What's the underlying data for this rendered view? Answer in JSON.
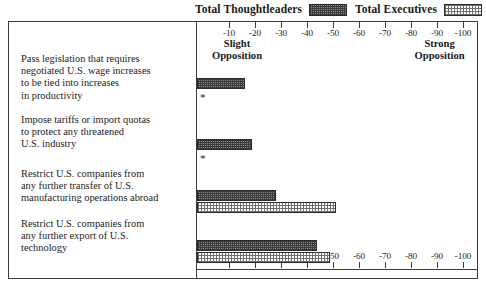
{
  "legend": {
    "entries": [
      {
        "label": "Total Thoughtleaders",
        "swatch": "dark-crosshatch-swatch",
        "color": "#8e8e8e"
      },
      {
        "label": "Total Executives",
        "swatch": "light-stipple-swatch",
        "color": "#e8e8e8"
      }
    ]
  },
  "axis": {
    "anchor_left": "Slight\nOpposition",
    "anchor_left_line1": "Slight",
    "anchor_left_line2": "Opposition",
    "anchor_right_line1": "Strong",
    "anchor_right_line2": "Opposition",
    "ticks": [
      "-10",
      "-20",
      "-30",
      "-40",
      "-50",
      "-60",
      "-70",
      "-80",
      "-90",
      "-100"
    ]
  },
  "notes": {
    "suppressed_marker": "*"
  },
  "chart_data": {
    "type": "bar",
    "orientation": "horizontal",
    "title": "",
    "xlabel": "",
    "ylabel": "",
    "xlim": [
      0,
      -100
    ],
    "grid": false,
    "legend_position": "top-right",
    "axis_anchors": {
      "left": "Slight Opposition",
      "right": "Strong Opposition"
    },
    "tick_labels": [
      "-10",
      "-20",
      "-30",
      "-40",
      "-50",
      "-60",
      "-70",
      "-80",
      "-90",
      "-100"
    ],
    "categories": [
      "Pass legislation that requires negotiated U.S. wage increases to be tied into increases in productivity",
      "Impose tariffs or import quotas to protect any threatened U.S. industry",
      "Restrict U.S. companies from any further transfer of U.S. manufacturing operations abroad",
      "Restrict U.S. companies from any further export of U.S. technology"
    ],
    "category_lines": [
      [
        "Pass legislation that requires",
        "negotiated U.S. wage increases",
        "to be tied into increases",
        "in productivity"
      ],
      [
        "Impose tariffs or import quotas",
        "to protect any threatened",
        "U.S. industry"
      ],
      [
        "Restrict U.S. companies from",
        "any further transfer of U.S.",
        "manufacturing operations abroad"
      ],
      [
        "Restrict U.S. companies from",
        "any further export of U.S.",
        "technology"
      ]
    ],
    "series": [
      {
        "name": "Total Thoughtleaders",
        "values": [
          -16,
          -19,
          -28,
          -44
        ]
      },
      {
        "name": "Total Executives",
        "values": [
          null,
          null,
          -51,
          -49
        ]
      }
    ],
    "markers": [
      {
        "category_index": 0,
        "series": "Total Executives",
        "symbol": "*"
      },
      {
        "category_index": 1,
        "series": "Total Executives",
        "symbol": "*"
      }
    ]
  }
}
